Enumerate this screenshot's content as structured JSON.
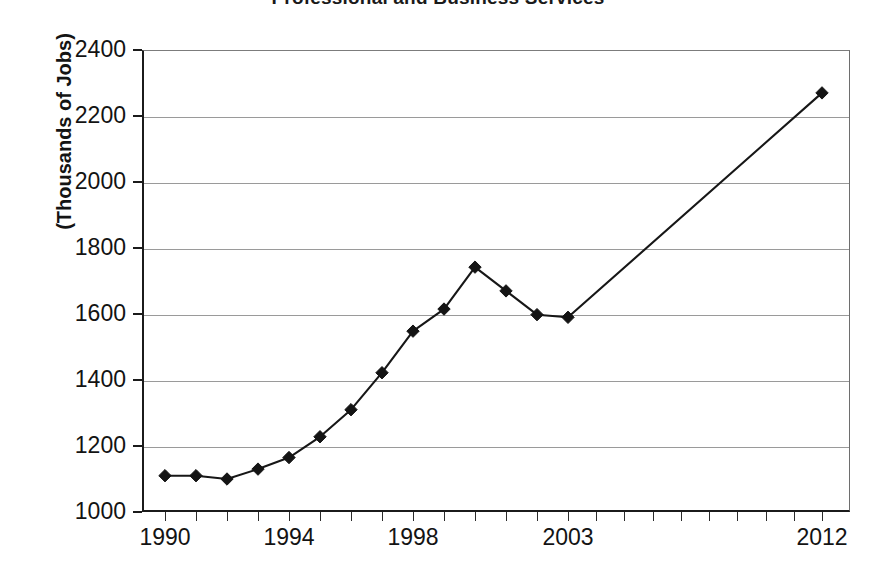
{
  "chart_data": {
    "type": "line",
    "title": "Professional and Business Services",
    "xlabel": "",
    "ylabel": "(Thousands of Jobs)",
    "ylim": [
      1000,
      2400
    ],
    "ytick_step": 200,
    "yticks": [
      "2400",
      "2200",
      "2000",
      "1800",
      "1600",
      "1400",
      "1200",
      "1000"
    ],
    "xticks_labeled": [
      "1990",
      "1994",
      "1998",
      "2003",
      "2012"
    ],
    "grid": "horizontal",
    "legend": "none",
    "marker": "filled-diamond",
    "line_color": "#171717",
    "grid_color": "#9a9a9a",
    "x": [
      1990,
      1991,
      1992,
      1993,
      1994,
      1995,
      1996,
      1997,
      1998,
      1999,
      2000,
      2001,
      2002,
      2003,
      2012
    ],
    "values": [
      1110,
      1110,
      1100,
      1130,
      1165,
      1228,
      1310,
      1422,
      1548,
      1615,
      1742,
      1670,
      1598,
      1590,
      2270
    ],
    "points": [
      {
        "year": "1990",
        "value": 1110
      },
      {
        "year": "1991",
        "value": 1110
      },
      {
        "year": "1992",
        "value": 1100
      },
      {
        "year": "1993",
        "value": 1130
      },
      {
        "year": "1994",
        "value": 1165
      },
      {
        "year": "1995",
        "value": 1228
      },
      {
        "year": "1996",
        "value": 1310
      },
      {
        "year": "1997",
        "value": 1422
      },
      {
        "year": "1998",
        "value": 1548
      },
      {
        "year": "1999",
        "value": 1615
      },
      {
        "year": "2000",
        "value": 1742
      },
      {
        "year": "2001",
        "value": 1670
      },
      {
        "year": "2002",
        "value": 1598
      },
      {
        "year": "2003",
        "value": 1590
      },
      {
        "year": "2012",
        "value": 2270
      }
    ]
  }
}
